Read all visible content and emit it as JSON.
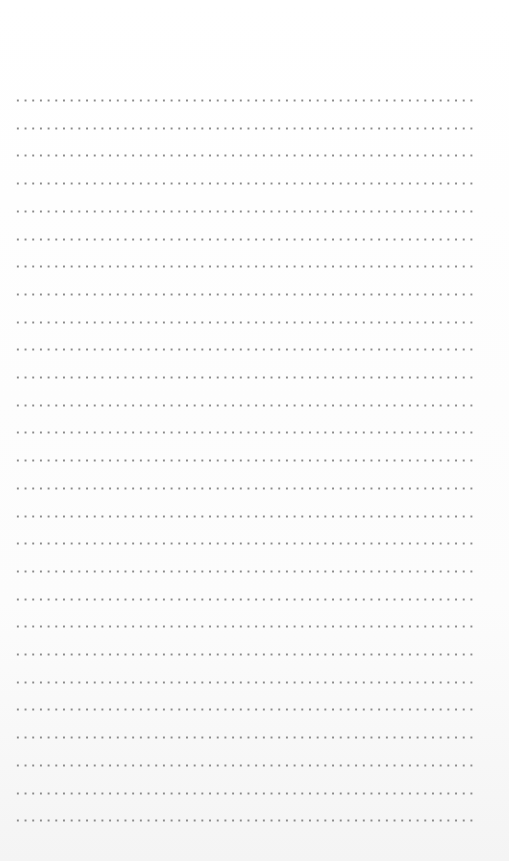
{
  "page": {
    "type": "dotted-ruled-paper",
    "background_color": "#fdfdfd",
    "dot_color": "#8a8a8a",
    "row_count": 27,
    "row_start_y": 99,
    "row_spacing": 27.7,
    "dot_spacing": 7.7,
    "left_margin": 14,
    "row_width": 462
  }
}
